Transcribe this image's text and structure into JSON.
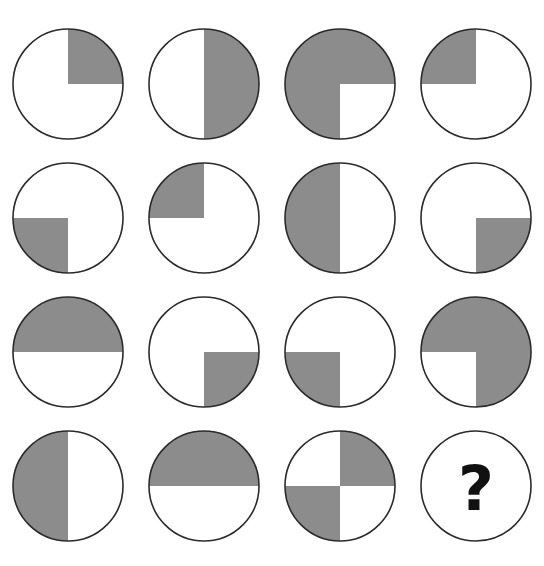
{
  "puzzle": {
    "type": "matrix-reasoning",
    "title": "Pie Quadrant Matrix Puzzle",
    "top_artifact_text": "",
    "colors": {
      "background": "#ffffff",
      "shaded_quadrant": "#8c8c8c",
      "unshaded_quadrant": "#ffffff",
      "outline": "#2b2b2b",
      "question_mark": "#111111"
    },
    "grid": {
      "rows": 4,
      "columns": 4,
      "cell_count": 16
    },
    "quadrant_order": [
      "top-left",
      "top-right",
      "bottom-right",
      "bottom-left"
    ],
    "answer_symbol": "?",
    "cells": [
      {
        "index": 1,
        "row": 1,
        "column": 1,
        "kind": "pie",
        "shaded_quadrants": [
          "top-right"
        ],
        "quadrants": {
          "top_left": false,
          "top_right": true,
          "bottom_right": false,
          "bottom_left": false
        },
        "shaded_count": 1,
        "fraction": "1/4",
        "description": "circle with top-right quadrant shaded"
      },
      {
        "index": 2,
        "row": 1,
        "column": 2,
        "kind": "pie",
        "shaded_quadrants": [
          "top-right",
          "bottom-right"
        ],
        "quadrants": {
          "top_left": false,
          "top_right": true,
          "bottom_right": true,
          "bottom_left": false
        },
        "shaded_count": 2,
        "fraction": "1/2",
        "description": "circle with right half shaded"
      },
      {
        "index": 3,
        "row": 1,
        "column": 3,
        "kind": "pie",
        "shaded_quadrants": [
          "top-left",
          "top-right",
          "bottom-left"
        ],
        "quadrants": {
          "top_left": true,
          "top_right": true,
          "bottom_right": false,
          "bottom_left": true
        },
        "shaded_count": 3,
        "fraction": "3/4",
        "description": "circle with all quadrants shaded except bottom-right"
      },
      {
        "index": 4,
        "row": 1,
        "column": 4,
        "kind": "pie",
        "shaded_quadrants": [
          "top-left"
        ],
        "quadrants": {
          "top_left": true,
          "top_right": false,
          "bottom_right": false,
          "bottom_left": false
        },
        "shaded_count": 1,
        "fraction": "1/4",
        "description": "circle with top-left quadrant shaded"
      },
      {
        "index": 5,
        "row": 2,
        "column": 1,
        "kind": "pie",
        "shaded_quadrants": [
          "bottom-left"
        ],
        "quadrants": {
          "top_left": false,
          "top_right": false,
          "bottom_right": false,
          "bottom_left": true
        },
        "shaded_count": 1,
        "fraction": "1/4",
        "description": "circle with bottom-left quadrant shaded"
      },
      {
        "index": 6,
        "row": 2,
        "column": 2,
        "kind": "pie",
        "shaded_quadrants": [
          "top-left"
        ],
        "quadrants": {
          "top_left": true,
          "top_right": false,
          "bottom_right": false,
          "bottom_left": false
        },
        "shaded_count": 1,
        "fraction": "1/4",
        "description": "circle with top-left quadrant shaded"
      },
      {
        "index": 7,
        "row": 2,
        "column": 3,
        "kind": "pie",
        "shaded_quadrants": [
          "top-left",
          "bottom-left"
        ],
        "quadrants": {
          "top_left": true,
          "top_right": false,
          "bottom_right": false,
          "bottom_left": true
        },
        "shaded_count": 2,
        "fraction": "1/2",
        "description": "circle with left half shaded"
      },
      {
        "index": 8,
        "row": 2,
        "column": 4,
        "kind": "pie",
        "shaded_quadrants": [
          "bottom-right"
        ],
        "quadrants": {
          "top_left": false,
          "top_right": false,
          "bottom_right": true,
          "bottom_left": false
        },
        "shaded_count": 1,
        "fraction": "1/4",
        "description": "circle with bottom-right quadrant shaded"
      },
      {
        "index": 9,
        "row": 3,
        "column": 1,
        "kind": "pie",
        "shaded_quadrants": [
          "top-left",
          "top-right"
        ],
        "quadrants": {
          "top_left": true,
          "top_right": true,
          "bottom_right": false,
          "bottom_left": false
        },
        "shaded_count": 2,
        "fraction": "1/2",
        "description": "circle with top half shaded"
      },
      {
        "index": 10,
        "row": 3,
        "column": 2,
        "kind": "pie",
        "shaded_quadrants": [
          "bottom-right"
        ],
        "quadrants": {
          "top_left": false,
          "top_right": false,
          "bottom_right": true,
          "bottom_left": false
        },
        "shaded_count": 1,
        "fraction": "1/4",
        "description": "circle with bottom-right quadrant shaded"
      },
      {
        "index": 11,
        "row": 3,
        "column": 3,
        "kind": "pie",
        "shaded_quadrants": [
          "bottom-left"
        ],
        "quadrants": {
          "top_left": false,
          "top_right": false,
          "bottom_right": false,
          "bottom_left": true
        },
        "shaded_count": 1,
        "fraction": "1/4",
        "description": "circle with bottom-left quadrant shaded"
      },
      {
        "index": 12,
        "row": 3,
        "column": 4,
        "kind": "pie",
        "shaded_quadrants": [
          "top-left",
          "top-right",
          "bottom-right"
        ],
        "quadrants": {
          "top_left": true,
          "top_right": true,
          "bottom_right": true,
          "bottom_left": false
        },
        "shaded_count": 3,
        "fraction": "3/4",
        "description": "circle with all quadrants shaded except bottom-left"
      },
      {
        "index": 13,
        "row": 4,
        "column": 1,
        "kind": "pie",
        "shaded_quadrants": [
          "top-left",
          "bottom-left"
        ],
        "quadrants": {
          "top_left": true,
          "top_right": false,
          "bottom_right": false,
          "bottom_left": true
        },
        "shaded_count": 2,
        "fraction": "1/2",
        "description": "circle with left half shaded"
      },
      {
        "index": 14,
        "row": 4,
        "column": 2,
        "kind": "pie",
        "shaded_quadrants": [
          "top-left",
          "top-right"
        ],
        "quadrants": {
          "top_left": true,
          "top_right": true,
          "bottom_right": false,
          "bottom_left": false
        },
        "shaded_count": 2,
        "fraction": "1/2",
        "description": "circle with top half shaded"
      },
      {
        "index": 15,
        "row": 4,
        "column": 3,
        "kind": "pie",
        "shaded_quadrants": [
          "top-right",
          "bottom-left"
        ],
        "quadrants": {
          "top_left": false,
          "top_right": true,
          "bottom_right": false,
          "bottom_left": true
        },
        "shaded_count": 2,
        "fraction": "1/2",
        "description": "circle with top-right and bottom-left quadrants shaded in a diagonal pattern"
      },
      {
        "index": 16,
        "row": 4,
        "column": 4,
        "kind": "question",
        "label": "?",
        "shaded_quadrants": [],
        "quadrants": {
          "top_left": false,
          "top_right": false,
          "bottom_right": false,
          "bottom_left": false
        },
        "shaded_count": 0,
        "fraction": "",
        "description": "empty circle containing a bold question mark marking the missing answer"
      }
    ]
  }
}
